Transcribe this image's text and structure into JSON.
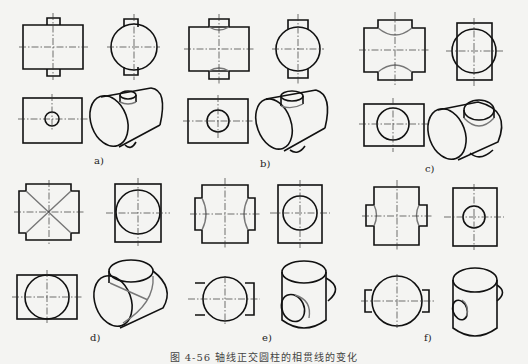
{
  "figure": {
    "caption": "图 4-56  轴线正交圆柱的相贯线的变化",
    "panels": [
      {
        "id": "a",
        "label": "a)",
        "description": "small vertical cylinder through large horizontal cylinder"
      },
      {
        "id": "b",
        "label": "b)",
        "description": "medium vertical cylinder through large horizontal cylinder"
      },
      {
        "id": "c",
        "label": "c)",
        "description": "larger vertical cylinder through horizontal cylinder"
      },
      {
        "id": "d",
        "label": "d)",
        "description": "equal diameter cylinders, straight-line intersection"
      },
      {
        "id": "e",
        "label": "e)",
        "description": "horizontal cylinder larger than vertical"
      },
      {
        "id": "f",
        "label": "f)",
        "description": "small horizontal cylinder through large vertical cylinder"
      }
    ],
    "colors": {
      "outline": "#111111",
      "intersection": "#777777",
      "background": "#f4f4f2"
    }
  }
}
